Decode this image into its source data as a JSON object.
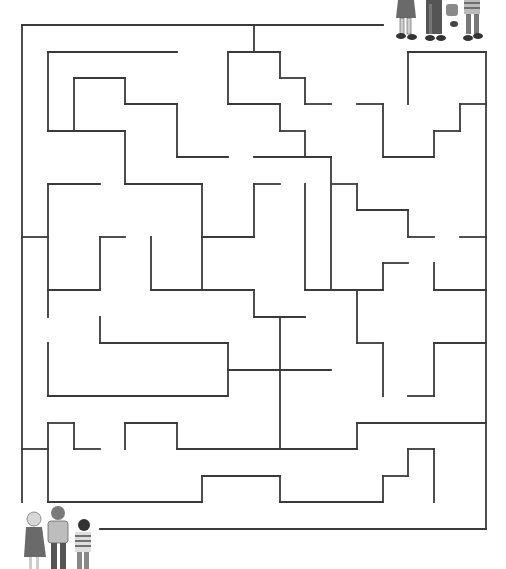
{
  "puzzle": {
    "type": "maze",
    "stroke_color": "#3a3a3a",
    "start_label": "children-bottom-left",
    "goal_label": "children-top-right",
    "walls": [
      [
        22,
        25,
        383,
        25
      ],
      [
        22,
        25,
        22,
        502
      ],
      [
        486,
        52,
        486,
        529
      ],
      [
        100,
        529,
        486,
        529
      ],
      [
        254,
        25,
        254,
        52
      ],
      [
        48,
        52,
        177,
        52
      ],
      [
        48,
        52,
        48,
        131
      ],
      [
        74,
        78,
        125,
        78
      ],
      [
        74,
        78,
        74,
        131
      ],
      [
        125,
        78,
        125,
        104
      ],
      [
        125,
        104,
        177,
        104
      ],
      [
        177,
        104,
        177,
        157
      ],
      [
        177,
        157,
        228,
        157
      ],
      [
        48,
        131,
        125,
        131
      ],
      [
        125,
        131,
        125,
        184
      ],
      [
        125,
        184,
        202,
        184
      ],
      [
        202,
        184,
        202,
        290
      ],
      [
        228,
        52,
        280,
        52
      ],
      [
        228,
        52,
        228,
        104
      ],
      [
        280,
        52,
        280,
        78
      ],
      [
        280,
        78,
        305,
        78
      ],
      [
        305,
        78,
        305,
        104
      ],
      [
        305,
        104,
        331,
        104
      ],
      [
        228,
        104,
        280,
        104
      ],
      [
        280,
        104,
        280,
        131
      ],
      [
        280,
        131,
        305,
        131
      ],
      [
        305,
        131,
        305,
        157
      ],
      [
        254,
        157,
        331,
        157
      ],
      [
        331,
        157,
        331,
        290
      ],
      [
        408,
        52,
        486,
        52
      ],
      [
        408,
        52,
        408,
        104
      ],
      [
        357,
        104,
        383,
        104
      ],
      [
        383,
        104,
        383,
        157
      ],
      [
        383,
        157,
        434,
        157
      ],
      [
        434,
        157,
        434,
        131
      ],
      [
        434,
        131,
        460,
        131
      ],
      [
        460,
        131,
        460,
        104
      ],
      [
        460,
        104,
        486,
        104
      ],
      [
        48,
        184,
        100,
        184
      ],
      [
        48,
        184,
        48,
        317
      ],
      [
        22,
        237,
        48,
        237
      ],
      [
        100,
        237,
        125,
        237
      ],
      [
        100,
        237,
        100,
        290
      ],
      [
        48,
        290,
        100,
        290
      ],
      [
        151,
        237,
        151,
        290
      ],
      [
        151,
        290,
        254,
        290
      ],
      [
        254,
        290,
        254,
        317
      ],
      [
        254,
        317,
        305,
        317
      ],
      [
        202,
        237,
        254,
        237
      ],
      [
        254,
        237,
        254,
        184
      ],
      [
        254,
        184,
        280,
        184
      ],
      [
        305,
        184,
        305,
        290
      ],
      [
        305,
        290,
        383,
        290
      ],
      [
        383,
        290,
        383,
        263
      ],
      [
        383,
        263,
        408,
        263
      ],
      [
        331,
        184,
        357,
        184
      ],
      [
        357,
        184,
        357,
        210
      ],
      [
        357,
        210,
        408,
        210
      ],
      [
        408,
        210,
        408,
        237
      ],
      [
        408,
        237,
        434,
        237
      ],
      [
        460,
        237,
        486,
        237
      ],
      [
        434,
        263,
        434,
        290
      ],
      [
        434,
        290,
        486,
        290
      ],
      [
        357,
        290,
        357,
        343
      ],
      [
        357,
        343,
        383,
        343
      ],
      [
        383,
        343,
        383,
        396
      ],
      [
        434,
        343,
        486,
        343
      ],
      [
        434,
        343,
        434,
        396
      ],
      [
        408,
        396,
        434,
        396
      ],
      [
        100,
        317,
        100,
        343
      ],
      [
        100,
        343,
        228,
        343
      ],
      [
        228,
        343,
        228,
        396
      ],
      [
        48,
        343,
        48,
        396
      ],
      [
        48,
        396,
        228,
        396
      ],
      [
        228,
        370,
        331,
        370
      ],
      [
        280,
        317,
        280,
        449
      ],
      [
        48,
        423,
        74,
        423
      ],
      [
        48,
        423,
        48,
        502
      ],
      [
        74,
        423,
        74,
        449
      ],
      [
        74,
        449,
        100,
        449
      ],
      [
        22,
        449,
        48,
        449
      ],
      [
        125,
        423,
        177,
        423
      ],
      [
        125,
        423,
        125,
        449
      ],
      [
        177,
        423,
        177,
        449
      ],
      [
        177,
        449,
        357,
        449
      ],
      [
        357,
        449,
        357,
        423
      ],
      [
        357,
        423,
        486,
        423
      ],
      [
        48,
        502,
        202,
        502
      ],
      [
        202,
        502,
        202,
        476
      ],
      [
        202,
        476,
        280,
        476
      ],
      [
        280,
        476,
        280,
        502
      ],
      [
        280,
        502,
        383,
        502
      ],
      [
        383,
        502,
        383,
        476
      ],
      [
        383,
        476,
        408,
        476
      ],
      [
        408,
        476,
        408,
        449
      ],
      [
        408,
        449,
        434,
        449
      ],
      [
        434,
        449,
        434,
        502
      ]
    ]
  }
}
